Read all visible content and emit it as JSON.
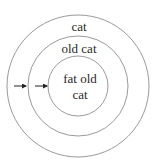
{
  "diagram": {
    "type": "nested-circles",
    "colors": {
      "stroke": "#9a9a9a",
      "text": "#2a2a2a",
      "arrow": "#222222",
      "background": "#ffffff"
    },
    "circles": [
      {
        "id": "outer",
        "label": "cat",
        "cx": 78,
        "cy": 86,
        "r": 71
      },
      {
        "id": "middle",
        "label": "old cat",
        "cx": 78,
        "cy": 86,
        "r": 50
      },
      {
        "id": "inner",
        "label_line1": "fat old",
        "label_line2": "cat",
        "cx": 78,
        "cy": 86,
        "r": 30
      }
    ],
    "arrows": [
      {
        "from": "outer",
        "to": "middle"
      },
      {
        "from": "middle",
        "to": "inner"
      }
    ]
  }
}
